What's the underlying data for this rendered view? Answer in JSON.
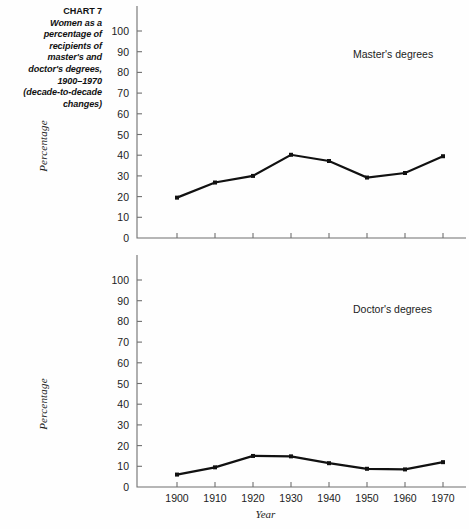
{
  "caption": {
    "chart_number": "CHART 7",
    "lines": [
      "Women as a",
      "percentage of",
      "recipients of",
      "master's and",
      "doctor's degrees,",
      "1900–1970",
      "(decade-to-decade",
      "changes)"
    ]
  },
  "axis": {
    "y_label": "Percentage",
    "x_label": "Year",
    "y_ticks": [
      0,
      10,
      20,
      30,
      40,
      50,
      60,
      70,
      80,
      90,
      100
    ],
    "x_ticks": [
      "1900",
      "1910",
      "1920",
      "1930",
      "1940",
      "1950",
      "1960",
      "1970"
    ]
  },
  "colors": {
    "line": "#111111",
    "axis": "#6f6f6f",
    "text": "#1c1c1c",
    "background": "#fefefe"
  },
  "chart_data": [
    {
      "type": "line",
      "title": "Master's degrees",
      "xlabel": "Year",
      "ylabel": "Percentage",
      "x": [
        1900,
        1910,
        1920,
        1930,
        1940,
        1950,
        1960,
        1970
      ],
      "categories": [
        "1900",
        "1910",
        "1920",
        "1930",
        "1940",
        "1950",
        "1960",
        "1970"
      ],
      "values": [
        19.5,
        26.8,
        30.0,
        40.2,
        37.2,
        29.2,
        31.4,
        39.5
      ],
      "xlim": [
        1895,
        1975
      ],
      "ylim": [
        0,
        100
      ],
      "grid": false,
      "legend": "none",
      "markers": true
    },
    {
      "type": "line",
      "title": "Doctor's degrees",
      "xlabel": "Year",
      "ylabel": "Percentage",
      "x": [
        1900,
        1910,
        1920,
        1930,
        1940,
        1950,
        1960,
        1970
      ],
      "categories": [
        "1900",
        "1910",
        "1920",
        "1930",
        "1940",
        "1950",
        "1960",
        "1970"
      ],
      "values": [
        6.0,
        9.5,
        15.0,
        14.8,
        11.5,
        8.8,
        8.5,
        12.0
      ],
      "xlim": [
        1895,
        1975
      ],
      "ylim": [
        0,
        100
      ],
      "grid": false,
      "legend": "none",
      "markers": true
    }
  ]
}
